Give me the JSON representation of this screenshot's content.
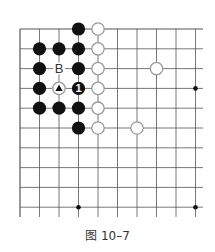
{
  "diagram": {
    "type": "go-board-fragment",
    "caption": "图 10–7",
    "grid": {
      "columns": 10,
      "rows": 10,
      "open_right": true,
      "open_bottom": true,
      "line_color": "#555555"
    },
    "star_points": [
      {
        "col": 9,
        "row": 3
      },
      {
        "col": 3,
        "row": 9
      },
      {
        "col": 9,
        "row": 9
      }
    ],
    "stones": [
      {
        "color": "black",
        "col": 3,
        "row": 0
      },
      {
        "color": "white",
        "col": 4,
        "row": 0
      },
      {
        "color": "black",
        "col": 1,
        "row": 1
      },
      {
        "color": "black",
        "col": 2,
        "row": 1
      },
      {
        "color": "black",
        "col": 3,
        "row": 1
      },
      {
        "color": "white",
        "col": 4,
        "row": 1
      },
      {
        "color": "black",
        "col": 1,
        "row": 2
      },
      {
        "color": "black",
        "col": 3,
        "row": 2
      },
      {
        "color": "white",
        "col": 4,
        "row": 2
      },
      {
        "color": "white",
        "col": 7,
        "row": 2
      },
      {
        "color": "black",
        "col": 1,
        "row": 3
      },
      {
        "color": "white",
        "col": 2,
        "row": 3,
        "marker": "triangle"
      },
      {
        "color": "black",
        "col": 3,
        "row": 3,
        "label": "1"
      },
      {
        "color": "white",
        "col": 4,
        "row": 3
      },
      {
        "color": "black",
        "col": 1,
        "row": 4
      },
      {
        "color": "black",
        "col": 2,
        "row": 4
      },
      {
        "color": "black",
        "col": 3,
        "row": 4
      },
      {
        "color": "white",
        "col": 4,
        "row": 4
      },
      {
        "color": "black",
        "col": 3,
        "row": 5
      },
      {
        "color": "white",
        "col": 4,
        "row": 5
      },
      {
        "color": "white",
        "col": 6,
        "row": 5
      }
    ],
    "point_labels": [
      {
        "text": "B",
        "col": 2,
        "row": 2
      }
    ],
    "colors": {
      "black_stone": "#111111",
      "white_stone_fill": "#ffffff",
      "white_stone_outline": "#999999",
      "label_text": "#333333"
    }
  }
}
